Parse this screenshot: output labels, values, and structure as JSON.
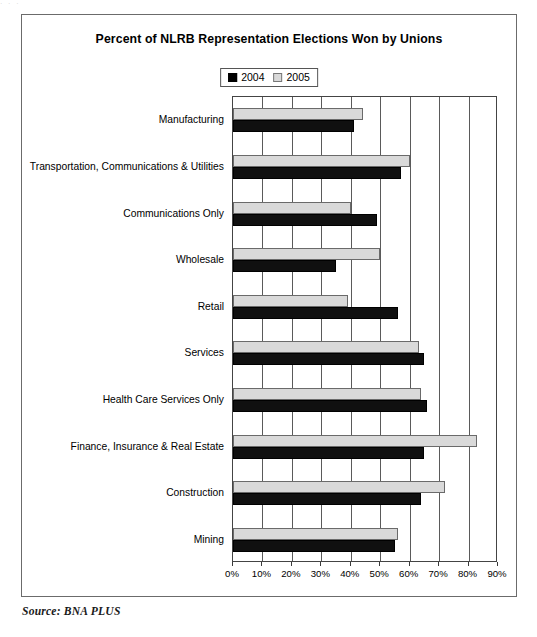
{
  "artifact": {
    "top_partial_text": "·                     ·              ·"
  },
  "footer": {
    "source": "Source: BNA PLUS"
  },
  "chart_data": {
    "type": "bar",
    "orientation": "horizontal",
    "title": "Percent of NLRB Representation Elections Won by Unions",
    "xlabel": "",
    "ylabel": "",
    "xlim": [
      0,
      90
    ],
    "grid": true,
    "legend_position": "top-center",
    "tick_labels": [
      "0%",
      "10%",
      "20%",
      "30%",
      "40%",
      "50%",
      "60%",
      "70%",
      "80%",
      "90%"
    ],
    "tick_values": [
      0,
      10,
      20,
      30,
      40,
      50,
      60,
      70,
      80,
      90
    ],
    "categories": [
      "Manufacturing",
      "Transportation, Communications & Utilities",
      "Communications Only",
      "Wholesale",
      "Retail",
      "Services",
      "Health Care Services Only",
      "Finance, Insurance & Real Estate",
      "Construction",
      "Mining"
    ],
    "series": [
      {
        "name": "2004",
        "color": "#101010",
        "values": [
          41,
          57,
          49,
          35,
          56,
          65,
          66,
          65,
          64,
          55
        ]
      },
      {
        "name": "2005",
        "color": "#d9d9d9",
        "values": [
          44,
          60,
          40,
          50,
          39,
          63,
          64,
          83,
          72,
          56
        ]
      }
    ]
  }
}
